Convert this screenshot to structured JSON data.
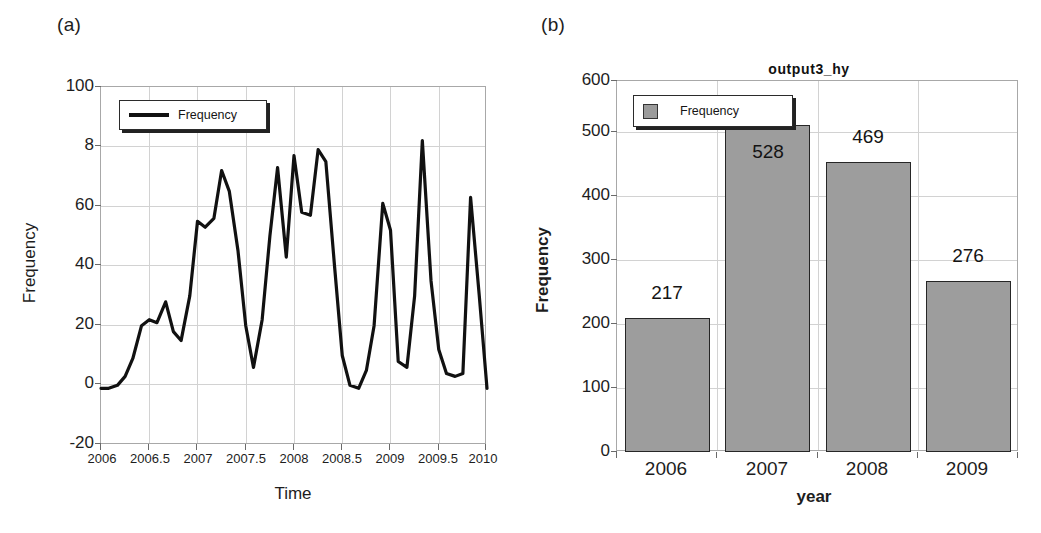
{
  "figure": {
    "background": "#ffffff",
    "line_color": "#111111",
    "bar_fill": "#9d9d9d",
    "bar_border": "#262626",
    "grid_color": "#d2d2d2",
    "frame_color": "#a8a8a8"
  },
  "panel_a": {
    "tag": "(a)",
    "title": "",
    "legend": {
      "label": "Frequency",
      "marker": "line-sample"
    },
    "xlabel": "Time",
    "ylabel": "Frequency",
    "y_ticks": [
      "-20",
      "0",
      "20",
      "40",
      "60",
      "8",
      "100"
    ],
    "x_ticks": [
      "2006",
      "2006.5",
      "2007",
      "2007.5",
      "2008",
      "2008.5",
      "2009",
      "2009.5",
      "2010"
    ]
  },
  "panel_b": {
    "tag": "(b)",
    "title": "output3_hy",
    "legend": {
      "label": "Frequency",
      "marker": "square-swatch"
    },
    "xlabel": "year",
    "ylabel": "Frequency",
    "y_ticks": [
      "0",
      "100",
      "200",
      "300",
      "400",
      "500",
      "600"
    ],
    "x_ticks": [
      "2006",
      "2007",
      "2008",
      "2009"
    ],
    "bar_labels": [
      "217",
      "528",
      "469",
      "276"
    ]
  },
  "chart_data": [
    {
      "id": "panel_a",
      "type": "line",
      "title": "",
      "xlabel": "Time",
      "ylabel": "Frequency",
      "xlim": [
        2006,
        2010
      ],
      "ylim": [
        -20,
        100
      ],
      "ytick_values": [
        -20,
        0,
        20,
        40,
        60,
        80,
        100
      ],
      "ytick_labels": [
        "-20",
        "0",
        "20",
        "40",
        "60",
        "8",
        "100"
      ],
      "xtick_values": [
        2006,
        2006.5,
        2007,
        2007.5,
        2008,
        2008.5,
        2009,
        2009.5,
        2010
      ],
      "xtick_labels": [
        "2006",
        "2006.5",
        "2007",
        "2007.5",
        "2008",
        "2008.5",
        "2009",
        "2009.5",
        "2010"
      ],
      "grid": true,
      "legend": [
        "Frequency"
      ],
      "legend_position": "upper-left",
      "series": [
        {
          "name": "Frequency",
          "x": [
            2006.0,
            2006.08,
            2006.17,
            2006.25,
            2006.33,
            2006.42,
            2006.5,
            2006.58,
            2006.67,
            2006.75,
            2006.83,
            2006.92,
            2007.0,
            2007.08,
            2007.17,
            2007.25,
            2007.33,
            2007.42,
            2007.5,
            2007.58,
            2007.67,
            2007.75,
            2007.83,
            2007.92,
            2008.0,
            2008.08,
            2008.17,
            2008.25,
            2008.33,
            2008.42,
            2008.5,
            2008.58,
            2008.67,
            2008.75,
            2008.83,
            2008.92,
            2009.0,
            2009.08,
            2009.17,
            2009.25,
            2009.33,
            2009.42,
            2009.5,
            2009.58,
            2009.67,
            2009.75,
            2009.83,
            2009.92,
            2010.0
          ],
          "y": [
            -1,
            -1,
            0,
            3,
            9,
            20,
            22,
            21,
            28,
            18,
            15,
            30,
            55,
            53,
            56,
            72,
            65,
            45,
            20,
            6,
            22,
            50,
            73,
            43,
            77,
            58,
            57,
            79,
            75,
            40,
            10,
            0,
            -1,
            5,
            20,
            61,
            52,
            8,
            6,
            30,
            82,
            35,
            12,
            4,
            3,
            4,
            63,
            30,
            -1
          ]
        }
      ]
    },
    {
      "id": "panel_b",
      "type": "bar",
      "title": "output3_hy",
      "xlabel": "year",
      "ylabel": "Frequency",
      "categories": [
        "2006",
        "2007",
        "2008",
        "2009"
      ],
      "values": [
        217,
        528,
        469,
        276
      ],
      "ylim": [
        0,
        600
      ],
      "ytick_values": [
        0,
        100,
        200,
        300,
        400,
        500,
        600
      ],
      "grid": true,
      "legend": [
        "Frequency"
      ],
      "legend_position": "upper-left",
      "data_labels": [
        "217",
        "528",
        "469",
        "276"
      ]
    }
  ]
}
